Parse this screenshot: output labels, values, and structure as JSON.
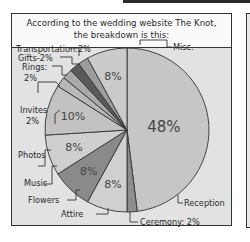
{
  "caption": {
    "line1": "According to the wedding website The Knot,",
    "line2": "the breakdown is this:"
  },
  "chart_data": {
    "type": "pie",
    "title": "According to the wedding website The Knot, the breakdown is this:",
    "categories": [
      "Reception",
      "Ceremony",
      "Attire",
      "Flowers",
      "Music",
      "Photos",
      "Invites",
      "Rings",
      "Gifts",
      "Transportation",
      "Misc."
    ],
    "values": [
      48,
      2,
      8,
      8,
      8,
      10,
      2,
      2,
      2,
      2,
      8
    ],
    "colors": [
      "#c6c6c6",
      "#8e8e8e",
      "#d0d0d0",
      "#8a8a8a",
      "#cfcfcf",
      "#c2c2c2",
      "#b8b8b8",
      "#a9a9a9",
      "#5a5a5a",
      "#9d9d9d",
      "#cbcbcb"
    ],
    "slice_labels": [
      "48%",
      "",
      "8%",
      "8%",
      "8%",
      "10%",
      "",
      "",
      "",
      "",
      "8%"
    ],
    "callouts": {
      "transportation": "Transportation:2%",
      "gifts": "Gifts-2%",
      "rings": "Rings:",
      "rings_pct": "2%",
      "invites": "Invites",
      "invites_pct": "2%",
      "photos": "Photos",
      "music": "Music",
      "flowers": "Flowers",
      "attire": "Attire",
      "misc": "Misc.",
      "reception": "Reception",
      "ceremony": "Ceremony: 2%"
    }
  }
}
